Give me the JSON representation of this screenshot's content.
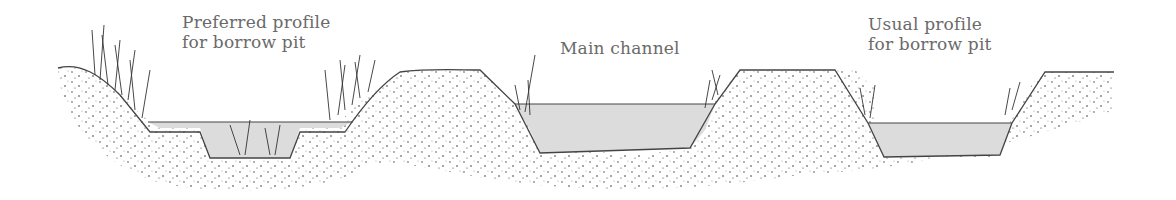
{
  "diagram": {
    "type": "cross-section",
    "labels": {
      "preferred": "Preferred profile\nfor borrow pit",
      "main": "Main channel",
      "usual": "Usual profile\nfor borrow pit"
    },
    "sections": [
      {
        "name": "preferred-borrow-pit",
        "description": "Wide shallow shelf with vegetated banks and deeper center"
      },
      {
        "name": "main-channel",
        "description": "Deep trapezoidal channel"
      },
      {
        "name": "usual-borrow-pit",
        "description": "Trapezoidal pit with steep sides"
      }
    ],
    "colors": {
      "water": "#dcdcdc",
      "line": "#444444",
      "soil_dots": "#333333",
      "text": "#6a6a6a"
    }
  }
}
